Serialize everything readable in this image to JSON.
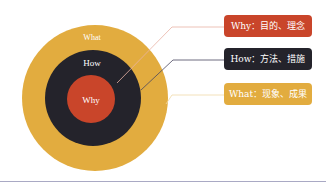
{
  "diagram": {
    "type": "golden-circle",
    "colors": {
      "what": "#e2ac3f",
      "how": "#24232b",
      "why": "#c9452a",
      "line_why": "#e8b2a4",
      "line_how": "#4a4860",
      "line_what": "#f0d9a8",
      "footer_rule": "#a9a9c4"
    },
    "rings": {
      "outer": "What",
      "middle": "How",
      "inner": "Why"
    },
    "labels": [
      {
        "id": "why",
        "text": "Why：目的、理念"
      },
      {
        "id": "how",
        "text": "How：方法、措施"
      },
      {
        "id": "what",
        "text": "What：现象、成果"
      }
    ]
  }
}
